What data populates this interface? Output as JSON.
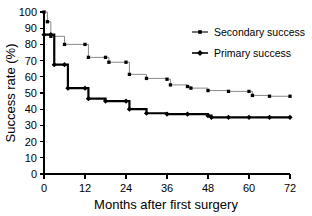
{
  "chart_data": {
    "type": "line",
    "title": "",
    "xlabel": "Months after first surgery",
    "ylabel": "Success rate (%)",
    "xlim": [
      0,
      72
    ],
    "ylim": [
      0,
      100
    ],
    "xticks": [
      0,
      12,
      24,
      36,
      48,
      60,
      72
    ],
    "yticks": [
      0,
      10,
      20,
      30,
      40,
      50,
      60,
      70,
      80,
      90,
      100
    ],
    "grid": false,
    "legend_position": "top-right",
    "step_style": "post",
    "series": [
      {
        "name": "Secondary success",
        "marker": "square",
        "color": "#000000",
        "line_color": "#8a8a8a",
        "x": [
          0,
          1,
          2,
          6,
          12,
          13,
          18,
          19,
          24,
          25,
          30,
          36,
          37,
          42,
          43,
          48,
          54,
          60,
          61,
          66,
          72
        ],
        "y": [
          100,
          94,
          85,
          80,
          80,
          72,
          72,
          69,
          69,
          61.5,
          59,
          58.5,
          55,
          54,
          53,
          51.5,
          51,
          51,
          48.5,
          48,
          48
        ]
      },
      {
        "name": "Primary success",
        "marker": "diamond",
        "color": "#000000",
        "line_color": "#000000",
        "x": [
          0,
          2,
          3,
          6,
          7,
          12,
          13,
          18,
          24,
          25,
          30,
          36,
          42,
          48,
          49,
          54,
          60,
          66,
          72
        ],
        "y": [
          86,
          86,
          67.5,
          67.5,
          53,
          53,
          46.5,
          45,
          45,
          40,
          37.5,
          37,
          37,
          36,
          35,
          35,
          35,
          35,
          35
        ]
      }
    ]
  },
  "legend": {
    "items": [
      {
        "label": "Secondary success",
        "marker": "square"
      },
      {
        "label": "Primary success",
        "marker": "diamond"
      }
    ]
  },
  "axes": {
    "x_title": "Months after first surgery",
    "y_title": "Success rate (%)",
    "x_tick_labels": [
      "0",
      "12",
      "24",
      "36",
      "48",
      "60",
      "72"
    ],
    "y_tick_labels": [
      "0",
      "10",
      "20",
      "30",
      "40",
      "50",
      "60",
      "70",
      "80",
      "90",
      "100"
    ]
  }
}
